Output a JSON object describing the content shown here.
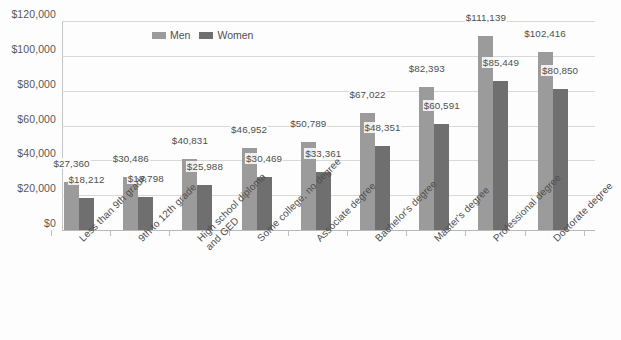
{
  "chart_data": {
    "type": "bar",
    "title": "",
    "xlabel": "",
    "ylabel": "",
    "ylim": [
      0,
      120000
    ],
    "ytick_labels": [
      "$120,000",
      "$100,000",
      "$80,000",
      "$60,000",
      "$40,000",
      "$20,000",
      "$0"
    ],
    "ytick_values": [
      120000,
      100000,
      80000,
      60000,
      40000,
      20000,
      0
    ],
    "grid": true,
    "legend_position": "top-left",
    "categories": [
      "Less than 9th grade",
      "9th to 12th grade",
      "High school diploma and GED",
      "Some college, no degree",
      "Associate degree",
      "Bachelor's degree",
      "Master's degree",
      "Professional degree",
      "Doctorate degree"
    ],
    "category_lines": [
      [
        "Less than 9th grade"
      ],
      [
        "9th to 12th grade"
      ],
      [
        "High school diploma",
        "and GED"
      ],
      [
        "Some college, no degree"
      ],
      [
        "Associate degree"
      ],
      [
        "Bachelor's degree"
      ],
      [
        "Master's degree"
      ],
      [
        "Professional degree"
      ],
      [
        "Doctorate degree"
      ]
    ],
    "series": [
      {
        "name": "Men",
        "color": "#9b9b9b",
        "values": [
          27360,
          30486,
          40831,
          46952,
          50789,
          67022,
          82393,
          111139,
          102416
        ],
        "labels": [
          "$27,360",
          "$30,486",
          "$40,831",
          "$46,952",
          "$50,789",
          "$67,022",
          "$82,393",
          "$111,139",
          "$102,416"
        ]
      },
      {
        "name": "Women",
        "color": "#6f6f6f",
        "values": [
          18212,
          18798,
          25988,
          30469,
          33361,
          48351,
          60591,
          85449,
          80850
        ],
        "labels": [
          "$18,212",
          "$18,798",
          "$25,988",
          "$30,469",
          "$33,361",
          "$48,351",
          "$60,591",
          "$85,449",
          "$80,850"
        ]
      }
    ]
  },
  "legend": {
    "items": [
      {
        "label": "Men",
        "key": "men"
      },
      {
        "label": "Women",
        "key": "women"
      }
    ]
  }
}
